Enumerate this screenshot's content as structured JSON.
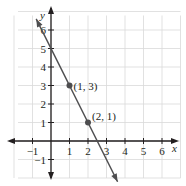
{
  "chart_data": {
    "type": "line",
    "title": "",
    "xlabel": "x",
    "ylabel": "y",
    "xlim": [
      -2,
      7
    ],
    "ylim": [
      -2,
      7
    ],
    "grid": true,
    "x_ticks": [
      -1,
      1,
      2,
      3,
      4,
      5,
      6
    ],
    "y_ticks": [
      -1,
      1,
      2,
      3,
      4,
      5,
      6
    ],
    "x_tick_labels": [
      "−1",
      "1",
      "2",
      "3",
      "4",
      "5",
      "6"
    ],
    "y_tick_labels": [
      "−1",
      "1",
      "2",
      "3",
      "4",
      "5",
      "6"
    ],
    "series": [
      {
        "name": "line",
        "equation": "y = -2x + 5",
        "x": [
          -0.8,
          3.6
        ],
        "y": [
          6.6,
          -2.2
        ]
      }
    ],
    "points": [
      {
        "x": 1,
        "y": 3,
        "label": "(1, 3)"
      },
      {
        "x": 2,
        "y": 1,
        "label": "(2, 1)"
      }
    ],
    "colors": {
      "axis": "#231f20",
      "grid": "#d9d9d9",
      "line": "#4d4d4f",
      "point": "#4d4d4f"
    }
  }
}
